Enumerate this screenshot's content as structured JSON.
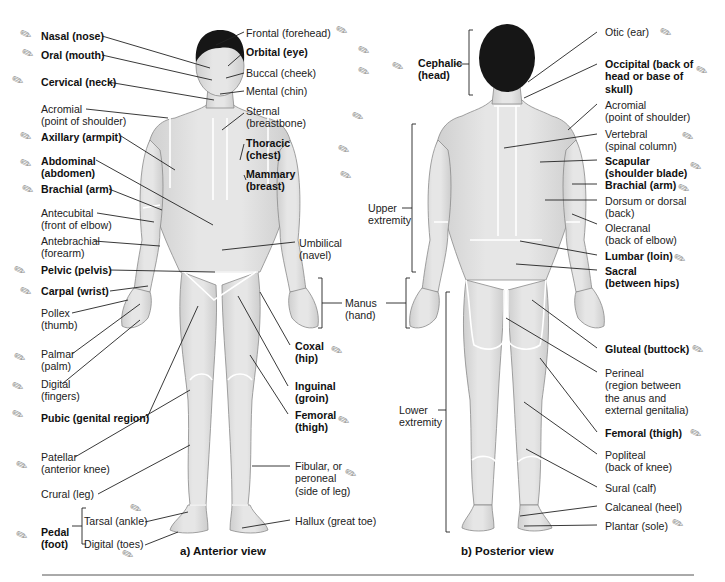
{
  "figure": {
    "captions": {
      "anterior": "a)  Anterior view",
      "posterior": "b)  Posterior view"
    },
    "colors": {
      "skin": "#e2e2e2",
      "skin_shadow": "#c9c9c9",
      "outline": "#8a8a8a",
      "hair": "#161616",
      "region_lines": "#ffffff",
      "leader_lines": "#222222",
      "background": "#ffffff"
    }
  },
  "anterior_left_labels": [
    {
      "line1": "Nasal (nose)",
      "bold": true
    },
    {
      "line1": "Oral (mouth)",
      "bold": true
    },
    {
      "line1": "Cervical (neck)",
      "bold": true
    },
    {
      "line1": "Acromial",
      "line2": "(point of shoulder)",
      "bold": false
    },
    {
      "line1": "Axillary (armpit)",
      "bold": true
    },
    {
      "line1": "Abdominal",
      "line2": "(abdomen)",
      "bold": true
    },
    {
      "line1": "Brachial (arm)",
      "bold": true
    },
    {
      "line1": "Antecubital",
      "line2": "(front of elbow)",
      "bold": false
    },
    {
      "line1": "Antebrachial",
      "line2": "(forearm)",
      "bold": false
    },
    {
      "line1": "Pelvic (pelvis)",
      "bold": true
    },
    {
      "line1": "Carpal (wrist)",
      "bold": true
    },
    {
      "line1": "Pollex",
      "line2": "(thumb)",
      "bold": false
    },
    {
      "line1": "Palmar",
      "line2": "(palm)",
      "bold": false
    },
    {
      "line1": "Digital",
      "line2": "(fingers)",
      "bold": false
    },
    {
      "line1": "Pubic (genital region)",
      "bold": true
    },
    {
      "line1": "Patellar",
      "line2": "(anterior knee)",
      "bold": false
    },
    {
      "line1": "Crural (leg)",
      "bold": false
    }
  ],
  "pedal": {
    "label1": "Pedal",
    "label2": "(foot)",
    "tarsal": "Tarsal (ankle)",
    "digital": "Digital (toes)"
  },
  "anterior_right_labels": [
    {
      "line1": "Frontal (forehead)",
      "bold": false
    },
    {
      "line1": "Orbital (eye)",
      "bold": true
    },
    {
      "line1": "Buccal (cheek)",
      "bold": false
    },
    {
      "line1": "Mental (chin)",
      "bold": false
    },
    {
      "line1": "Sternal",
      "line2": "(breastbone)",
      "bold": false
    },
    {
      "line1": "Thoracic",
      "line2": "(chest)",
      "bold": true
    },
    {
      "line1": "Mammary",
      "line2": "(breast)",
      "bold": true
    },
    {
      "line1": "Umbilical",
      "line2": "(navel)",
      "bold": false
    },
    {
      "line1": "Coxal",
      "line2": "(hip)",
      "bold": true
    },
    {
      "line1": "Inguinal",
      "line2": "(groin)",
      "bold": true
    },
    {
      "line1": "Femoral",
      "line2": "(thigh)",
      "bold": true
    },
    {
      "line1": "Fibular, or",
      "line2": "peroneal",
      "line3": "(side of leg)",
      "bold": false
    },
    {
      "line1": "Hallux (great toe)",
      "bold": false
    }
  ],
  "middle_labels": {
    "manus": {
      "line1": "Manus",
      "line2": "(hand)"
    },
    "cephalic": {
      "line1": "Cephalic",
      "line2": "(head)"
    },
    "upper_extremity": {
      "line1": "Upper",
      "line2": "extremity"
    },
    "lower_extremity": {
      "line1": "Lower",
      "line2": "extremity"
    }
  },
  "posterior_right_labels": [
    {
      "line1": "Otic (ear)",
      "bold": false
    },
    {
      "line1": "Occipital (back of",
      "line2": "head or base of",
      "line3": "skull)",
      "bold": true
    },
    {
      "line1": "Acromial",
      "line2": "(point of shoulder)",
      "bold": false
    },
    {
      "line1": "Vertebral",
      "line2": "(spinal column)",
      "bold": false
    },
    {
      "line1": "Scapular",
      "line2": "(shoulder blade)",
      "bold": true
    },
    {
      "line1": "Brachial (arm)",
      "bold": true
    },
    {
      "line1": "Dorsum or dorsal",
      "line2": "(back)",
      "bold": false
    },
    {
      "line1": "Olecranal",
      "line2": "(back of elbow)",
      "bold": false
    },
    {
      "line1": "Lumbar (loin)",
      "bold": true
    },
    {
      "line1": "Sacral",
      "line2": "(between hips)",
      "bold": true
    },
    {
      "line1": "Gluteal (buttock)",
      "bold": true
    },
    {
      "line1": "Perineal",
      "line2": "(region between",
      "line3": "the anus and",
      "line4": "external genitalia)",
      "bold": false
    },
    {
      "line1": "Femoral (thigh)",
      "bold": true
    },
    {
      "line1": "Popliteal",
      "line2": "(back of knee)",
      "bold": false
    },
    {
      "line1": "Sural (calf)",
      "bold": false
    },
    {
      "line1": "Calcaneal (heel)",
      "bold": false
    },
    {
      "line1": "Plantar (sole)",
      "bold": false
    }
  ]
}
